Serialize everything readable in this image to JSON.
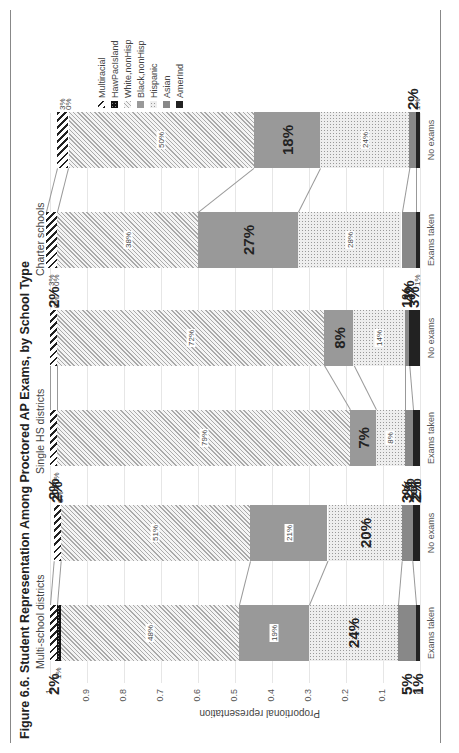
{
  "header": {
    "title": "Figure 6.6. Student Representation Among Proctored AP Exams, by School Type"
  },
  "chart_data": {
    "type": "bar",
    "stacked": true,
    "orientation": "vertical (image rotated 90 degrees)",
    "title": "Figure 6.6. Student Representation Among Proctored AP Exams, by School Type",
    "xlabel": "",
    "ylabel": "Proportional representation",
    "ylim": [
      0,
      1
    ],
    "yticks": [
      "0",
      "0.1",
      "0.2",
      "0.3",
      "0.4",
      "0.5",
      "0.6",
      "0.7",
      "0.8",
      "0.9",
      "1"
    ],
    "grid": true,
    "legend_position": "right",
    "legend": [
      "Multiracial",
      "HawPacIsland",
      "White,nonHisp",
      "Black,nonHisp",
      "Hispanic",
      "Asian",
      "AmerInd"
    ],
    "panels": [
      {
        "name": "Multi-school districts",
        "categories": [
          "Exams taken",
          "No exams"
        ],
        "series": [
          {
            "name": "AmerInd",
            "values": [
              0.01,
              0.02
            ],
            "labels": [
              "1%",
              "2%"
            ]
          },
          {
            "name": "Asian",
            "values": [
              0.05,
              0.03
            ],
            "labels": [
              "5%",
              "3%"
            ]
          },
          {
            "name": "Hispanic",
            "values": [
              0.24,
              0.2
            ],
            "labels": [
              "24%",
              "20%"
            ]
          },
          {
            "name": "Black,nonHisp",
            "values": [
              0.19,
              0.21
            ],
            "labels": [
              "19%",
              "21%"
            ]
          },
          {
            "name": "White,nonHisp",
            "values": [
              0.48,
              0.51
            ],
            "labels": [
              "48%",
              "51%"
            ]
          },
          {
            "name": "HawPacIsland",
            "values": [
              0.01,
              0.0
            ],
            "labels": [
              "1%",
              "0%"
            ]
          },
          {
            "name": "Multiracial",
            "values": [
              0.02,
              0.02
            ],
            "labels": [
              "2%",
              "2%"
            ]
          }
        ]
      },
      {
        "name": "Single HS districts",
        "categories": [
          "Exams taken",
          "No exams"
        ],
        "series": [
          {
            "name": "AmerInd",
            "values": [
              0.02,
              0.03
            ],
            "labels": [
              "2%",
              "3%"
            ]
          },
          {
            "name": "Asian",
            "values": [
              0.02,
              0.01
            ],
            "labels": [
              "2%",
              "1%"
            ]
          },
          {
            "name": "Hispanic",
            "values": [
              0.08,
              0.14
            ],
            "labels": [
              "8%",
              "14%"
            ]
          },
          {
            "name": "Black,nonHisp",
            "values": [
              0.07,
              0.08
            ],
            "labels": [
              "7%",
              "8%"
            ]
          },
          {
            "name": "White,nonHisp",
            "values": [
              0.79,
              0.72
            ],
            "labels": [
              "79%",
              "72%"
            ]
          },
          {
            "name": "HawPacIsland",
            "values": [
              0.0,
              0.0
            ],
            "labels": [
              "0%",
              "0%"
            ]
          },
          {
            "name": "Multiracial",
            "values": [
              0.02,
              0.02
            ],
            "labels": [
              "2%",
              "2%"
            ]
          }
        ]
      },
      {
        "name": "Charter schools",
        "categories": [
          "Exams taken",
          "No exams"
        ],
        "series": [
          {
            "name": "AmerInd",
            "values": [
              0.01,
              0.01
            ],
            "labels": [
              "1%",
              "1%"
            ]
          },
          {
            "name": "Asian",
            "values": [
              0.04,
              0.02
            ],
            "labels": [
              "4%",
              "2%"
            ]
          },
          {
            "name": "Hispanic",
            "values": [
              0.28,
              0.24
            ],
            "labels": [
              "28%",
              "24%"
            ]
          },
          {
            "name": "Black,nonHisp",
            "values": [
              0.27,
              0.18
            ],
            "labels": [
              "27%",
              "18%"
            ]
          },
          {
            "name": "White,nonHisp",
            "values": [
              0.38,
              0.5
            ],
            "labels": [
              "38%",
              "50%"
            ]
          },
          {
            "name": "HawPacIsland",
            "values": [
              0.0,
              0.0
            ],
            "labels": [
              "0%",
              "0%"
            ]
          },
          {
            "name": "Multiracial",
            "values": [
              0.03,
              0.03
            ],
            "labels": [
              "3%",
              "3%"
            ]
          }
        ]
      }
    ]
  },
  "colors": {
    "AmerInd": "#222222",
    "Asian": "#888888",
    "Hispanic": "#dddddd",
    "Black,nonHisp": "#999999",
    "White,nonHisp": "#eeeeee",
    "HawPacIsland": "#111111",
    "Multiracial": "#444444"
  }
}
